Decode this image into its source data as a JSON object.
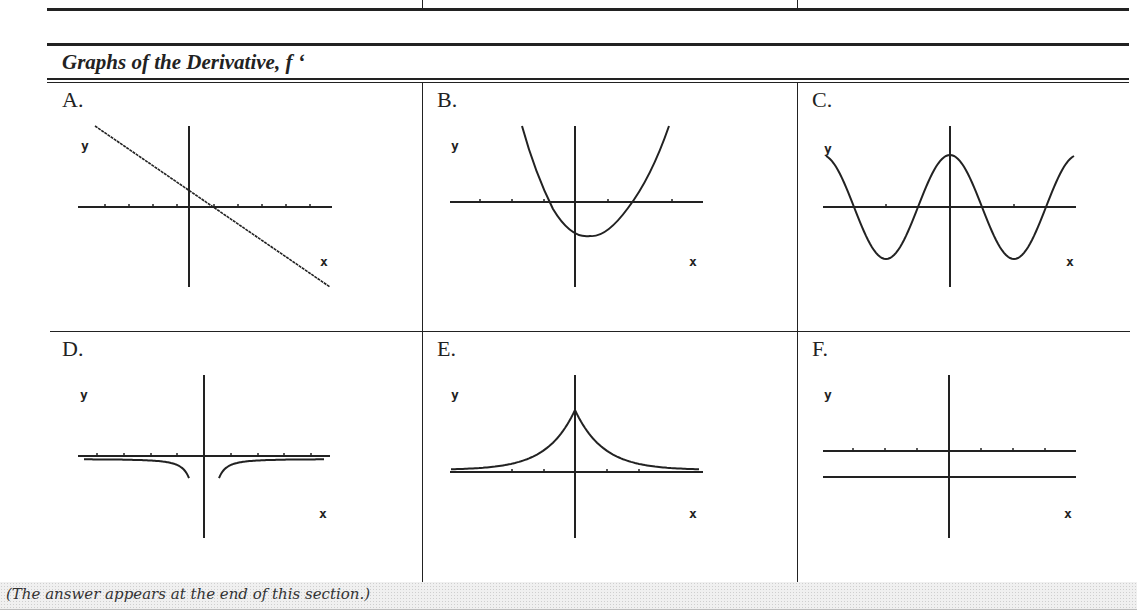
{
  "section": {
    "title": "Graphs of the Derivative, f ‘"
  },
  "cells": [
    {
      "label": "A.",
      "y_label": "y",
      "x_label": "x",
      "description": "decreasing straight line crossing x-axis slightly right of origin"
    },
    {
      "label": "B.",
      "y_label": "y",
      "x_label": "x",
      "description": "upward parabola with vertex below x-axis, slightly right of origin"
    },
    {
      "label": "C.",
      "y_label": "y",
      "x_label": "x",
      "description": "cosine-like wave with maximum at y-axis"
    },
    {
      "label": "D.",
      "y_label": "y",
      "x_label": "x",
      "description": "negative curve -1/x^2 style, asymptotic to y-axis from both sides going down"
    },
    {
      "label": "E.",
      "y_label": "y",
      "x_label": "x",
      "description": "positive bell/cusp-shaped peak at origin decaying to x-axis"
    },
    {
      "label": "F.",
      "y_label": "y",
      "x_label": "x",
      "description": "horizontal line below x-axis (negative constant)"
    }
  ],
  "footer": {
    "note": "(The answer appears at the end of this section.)"
  }
}
